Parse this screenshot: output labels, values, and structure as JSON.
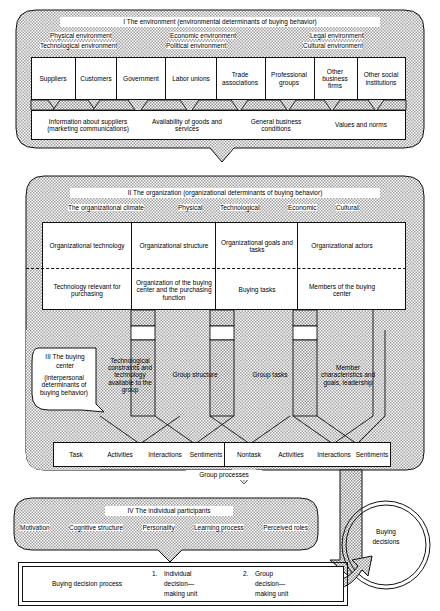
{
  "figure": {
    "title_hidden": "Model of organizational buying behavior",
    "shading_color": "#cfcfcf",
    "line_color": "#111111",
    "panel_fill": "#ffffff"
  },
  "section_i": {
    "heading": "I  The environment (environmental determinants of buying behavior)",
    "environments": [
      {
        "line1": "Physical environment",
        "line2": "Technological environment"
      },
      {
        "line1": "Economic environment",
        "line2": "Political environment"
      },
      {
        "line1": "Legal environment",
        "line2": "Cultural environment"
      }
    ],
    "actors": [
      "Suppliers",
      "Customers",
      "Government",
      "Labor unions",
      "Trade associations",
      "Professional groups",
      "Other business firms",
      "Other social institutions"
    ],
    "flows": [
      "Information about suppliers (marketing communications)",
      "Availability of goods and services",
      "General business conditions",
      "Values and norms"
    ]
  },
  "section_ii": {
    "heading": "II  The organization (organizational determinants of buying behavior)",
    "climate_label": "The organizational climate",
    "climate_items": [
      "Physical",
      "Technological",
      "Economic",
      "Cultural"
    ],
    "columns": [
      {
        "top": "Organizational technology",
        "bottom": "Technology relevant for purchasing"
      },
      {
        "top": "Organizational structure",
        "bottom": "Organization of the buying center and the purchasing function"
      },
      {
        "top": "Organizational goals and tasks",
        "bottom": "Buying tasks"
      },
      {
        "top": "Organizational actors",
        "bottom": "Members of the buying center"
      }
    ]
  },
  "section_iii": {
    "heading_line1": "III  The buying",
    "heading_line2": "center",
    "subheading": "(interpersonal determinants of buying behavior)",
    "columns": [
      "Technological constraints and technology available to the group",
      "Group structure",
      "Group tasks",
      "Member characteristics and goals, leadership"
    ],
    "processes_left": [
      "Task",
      "Activities",
      "Interactions",
      "Sentiments"
    ],
    "processes_right": [
      "Nontask",
      "Activities",
      "Interactions",
      "Sentiments"
    ],
    "processes_caption": "Group processes"
  },
  "section_iv": {
    "heading": "IV  The individual participants",
    "attributes": [
      "Motivation",
      "Cognitive structure",
      "Personality",
      "Learning process",
      "Perceived roles"
    ],
    "process_label": "Buying decision process",
    "units": [
      {
        "num": "1.",
        "l1": "Individual",
        "l2": "decision—",
        "l3": "making unit"
      },
      {
        "num": "2.",
        "l1": "Group",
        "l2": "decision—",
        "l3": "making unit"
      }
    ]
  },
  "outcome": {
    "line1": "Buying",
    "line2": "decisions"
  }
}
